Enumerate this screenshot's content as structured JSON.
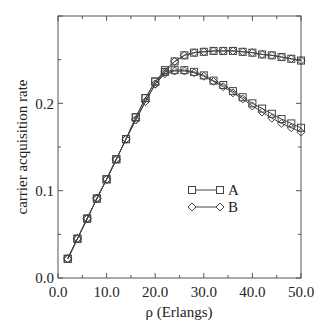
{
  "chart_data": {
    "type": "line",
    "title": "",
    "xlabel": "ρ  (Erlangs)",
    "ylabel": "carrier acquisition rate",
    "xlim": [
      0,
      50
    ],
    "ylim": [
      0,
      0.3
    ],
    "xticks": [
      "0.0",
      "10.0",
      "20.0",
      "30.0",
      "40.0",
      "50.0"
    ],
    "yticks": [
      "0.0",
      "0.1",
      "0.2"
    ],
    "grid": false,
    "legend_position": "center-right",
    "x": [
      2,
      4,
      6,
      8,
      10,
      12,
      14,
      16,
      18,
      20,
      22,
      24,
      26,
      28,
      30,
      32,
      34,
      36,
      38,
      40,
      42,
      44,
      46,
      48,
      50
    ],
    "series": [
      {
        "name": "A",
        "marker": "square",
        "curves": [
          {
            "label": "A-upper",
            "values": [
              0.022,
              0.045,
              0.068,
              0.091,
              0.113,
              0.136,
              0.159,
              0.184,
              0.206,
              0.225,
              0.238,
              0.248,
              0.255,
              0.258,
              0.259,
              0.26,
              0.26,
              0.26,
              0.259,
              0.258,
              0.256,
              0.255,
              0.253,
              0.251,
              0.249
            ]
          },
          {
            "label": "A-lower",
            "values": [
              0.022,
              0.045,
              0.068,
              0.091,
              0.113,
              0.136,
              0.159,
              0.184,
              0.206,
              0.225,
              0.236,
              0.238,
              0.238,
              0.236,
              0.232,
              0.226,
              0.221,
              0.214,
              0.207,
              0.2,
              0.194,
              0.188,
              0.182,
              0.177,
              0.172
            ]
          }
        ]
      },
      {
        "name": "B",
        "marker": "diamond",
        "curves": [
          {
            "label": "B-upper",
            "values": [
              0.022,
              0.045,
              0.068,
              0.091,
              0.113,
              0.136,
              0.159,
              0.181,
              0.202,
              0.222,
              0.236,
              0.248,
              0.255,
              0.258,
              0.259,
              0.26,
              0.26,
              0.26,
              0.259,
              0.258,
              0.256,
              0.255,
              0.253,
              0.251,
              0.249
            ]
          },
          {
            "label": "B-lower",
            "values": [
              0.022,
              0.045,
              0.068,
              0.091,
              0.113,
              0.136,
              0.159,
              0.181,
              0.202,
              0.222,
              0.234,
              0.237,
              0.237,
              0.235,
              0.231,
              0.225,
              0.219,
              0.212,
              0.205,
              0.197,
              0.19,
              0.183,
              0.177,
              0.172,
              0.167
            ]
          }
        ]
      }
    ]
  },
  "legend": {
    "items": [
      {
        "label": "A",
        "marker": "square"
      },
      {
        "label": "B",
        "marker": "diamond"
      }
    ]
  },
  "axes": {
    "xlabel": "ρ  (Erlangs)",
    "ylabel": "carrier acquisition rate",
    "xticks": [
      "0.0",
      "10.0",
      "20.0",
      "30.0",
      "40.0",
      "50.0"
    ],
    "yticks": [
      "0.0",
      "0.1",
      "0.2"
    ]
  }
}
